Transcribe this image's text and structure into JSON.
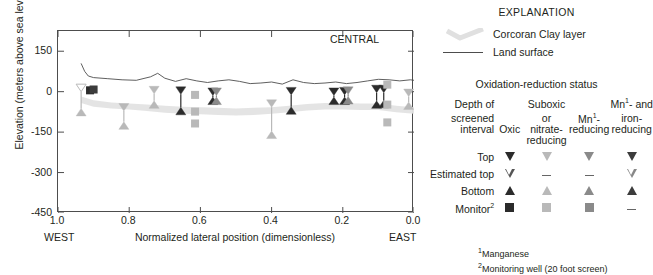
{
  "chart_data": {
    "type": "scatter",
    "title": "",
    "panel_label": "CENTRAL",
    "xlabel": "Normalized lateral position (dimensionless)",
    "ylabel": "Elevation (meters above sea level)",
    "xlim": [
      1.0,
      0.0
    ],
    "ylim": [
      -450,
      225
    ],
    "x_ticks": [
      "1.0",
      "0.8",
      "0.6",
      "0.4",
      "0.2",
      "0.0"
    ],
    "x_tick_values": [
      1.0,
      0.8,
      0.6,
      0.4,
      0.2,
      0.0
    ],
    "y_ticks": [
      "150",
      "0",
      "-150",
      "-300",
      "-450"
    ],
    "y_tick_values": [
      150,
      0,
      -150,
      -300,
      -450
    ],
    "x_left_direction": "WEST",
    "x_right_direction": "EAST",
    "grid": false,
    "legend_position": "right",
    "series": [
      {
        "name": "Land surface",
        "type": "line",
        "color": "#4d4d4d",
        "x": [
          0.935,
          0.925,
          0.915,
          0.9,
          0.86,
          0.82,
          0.78,
          0.74,
          0.72,
          0.7,
          0.67,
          0.64,
          0.61,
          0.58,
          0.55,
          0.52,
          0.49,
          0.46,
          0.43,
          0.4,
          0.37,
          0.34,
          0.31,
          0.28,
          0.25,
          0.22,
          0.19,
          0.16,
          0.13,
          0.1,
          0.07,
          0.04,
          0.01,
          0.0
        ],
        "y": [
          105,
          75,
          58,
          52,
          48,
          44,
          42,
          55,
          68,
          50,
          38,
          48,
          40,
          34,
          40,
          44,
          38,
          30,
          32,
          36,
          28,
          44,
          34,
          30,
          32,
          36,
          30,
          34,
          40,
          46,
          44,
          40,
          44,
          42
        ]
      },
      {
        "name": "Corcoran Clay layer",
        "type": "band",
        "color": "#e3e3e3",
        "x": [
          0.935,
          0.9,
          0.85,
          0.8,
          0.75,
          0.7,
          0.65,
          0.6,
          0.55,
          0.5,
          0.45,
          0.4,
          0.35,
          0.3,
          0.25,
          0.2,
          0.15,
          0.1,
          0.05,
          0.0
        ],
        "y_upper": [
          -18,
          -32,
          -40,
          -44,
          -48,
          -52,
          -56,
          -58,
          -60,
          -62,
          -60,
          -58,
          -52,
          -46,
          -42,
          -42,
          -44,
          -44,
          -52,
          -58
        ],
        "y_lower": [
          -42,
          -56,
          -62,
          -66,
          -72,
          -78,
          -82,
          -84,
          -86,
          -88,
          -86,
          -82,
          -76,
          -70,
          -66,
          -66,
          -68,
          -68,
          -76,
          -82
        ]
      }
    ],
    "wells": [
      {
        "x": 0.935,
        "top": 0,
        "bottom": -62,
        "status": "suboxic",
        "kind": "estimated_top"
      },
      {
        "x": 0.91,
        "top": 5,
        "bottom": -48,
        "status": "oxic",
        "kind": "monitor"
      },
      {
        "x": 0.9,
        "top": 8,
        "bottom": -44,
        "status": "mn_iron",
        "kind": "monitor"
      },
      {
        "x": 0.815,
        "top": -72,
        "bottom": -112,
        "status": "suboxic",
        "kind": "top_bottom"
      },
      {
        "x": 0.73,
        "top": -8,
        "bottom": -34,
        "status": "suboxic",
        "kind": "top_bottom"
      },
      {
        "x": 0.655,
        "top": -10,
        "bottom": -58,
        "status": "oxic",
        "kind": "top_bottom"
      },
      {
        "x": 0.615,
        "top": -12,
        "bottom": -12,
        "status": "suboxic",
        "kind": "monitor"
      },
      {
        "x": 0.615,
        "top": -74,
        "bottom": -74,
        "status": "suboxic",
        "kind": "monitor"
      },
      {
        "x": 0.615,
        "top": -118,
        "bottom": -118,
        "status": "suboxic",
        "kind": "monitor"
      },
      {
        "x": 0.565,
        "top": -14,
        "bottom": -20,
        "status": "oxic",
        "kind": "top_bottom"
      },
      {
        "x": 0.555,
        "top": -14,
        "bottom": -20,
        "status": "mn_reducing",
        "kind": "top_bottom"
      },
      {
        "x": 0.4,
        "top": -58,
        "bottom": -146,
        "status": "suboxic",
        "kind": "top_bottom"
      },
      {
        "x": 0.345,
        "top": -12,
        "bottom": -56,
        "status": "oxic",
        "kind": "top_bottom"
      },
      {
        "x": 0.225,
        "top": -14,
        "bottom": -20,
        "status": "oxic",
        "kind": "top_bottom"
      },
      {
        "x": 0.195,
        "top": -12,
        "bottom": -20,
        "status": "oxic",
        "kind": "top_bottom"
      },
      {
        "x": 0.185,
        "top": -10,
        "bottom": -18,
        "status": "mn_reducing",
        "kind": "top_bottom"
      },
      {
        "x": 0.105,
        "top": -4,
        "bottom": -34,
        "status": "oxic",
        "kind": "top_bottom"
      },
      {
        "x": 0.085,
        "top": -4,
        "bottom": -32,
        "status": "oxic",
        "kind": "top_bottom"
      },
      {
        "x": 0.075,
        "top": 26,
        "bottom": 26,
        "status": "suboxic",
        "kind": "monitor"
      },
      {
        "x": 0.075,
        "top": -48,
        "bottom": -48,
        "status": "suboxic",
        "kind": "monitor"
      },
      {
        "x": 0.075,
        "top": -114,
        "bottom": -114,
        "status": "suboxic",
        "kind": "monitor"
      },
      {
        "x": 0.015,
        "top": -18,
        "bottom": -38,
        "status": "suboxic",
        "kind": "top_bottom"
      }
    ]
  },
  "plot": {
    "central_label": "CENTRAL",
    "yaxis_title": "Elevation (meters above sea level)",
    "xaxis_title": "Normalized lateral position (dimensionless)",
    "west": "WEST",
    "east": "EAST"
  },
  "explanation": {
    "title": "EXPLANATION",
    "clay_label": "Corcoran Clay layer",
    "land_surface_label": "Land surface",
    "redox_title": "Oxidation-reduction status",
    "columns": [
      {
        "id": "depth",
        "lines": [
          "Depth of",
          "screened",
          "interval"
        ]
      },
      {
        "id": "oxic",
        "lines": [
          "",
          "",
          "Oxic"
        ]
      },
      {
        "id": "suboxic",
        "lines": [
          "Suboxic",
          "or",
          "nitrate-",
          "reducing"
        ]
      },
      {
        "id": "mn",
        "lines": [
          "",
          "Mn¹-",
          "reducing"
        ]
      },
      {
        "id": "mn_iron",
        "lines": [
          "Mn¹- and",
          "iron-",
          "reducing"
        ]
      }
    ],
    "col_head_oxic": "Oxic",
    "col_head_suboxic_1": "Suboxic",
    "col_head_suboxic_2": "or",
    "col_head_suboxic_3": "nitrate-",
    "col_head_suboxic_4": "reducing",
    "col_head_mn_1": "Mn",
    "col_head_mn_sup": "1",
    "col_head_mn_2": "-",
    "col_head_mn_3": "reducing",
    "col_head_mniron_1": "Mn",
    "col_head_mniron_sup": "1",
    "col_head_mniron_2": "- and",
    "col_head_mniron_3": "iron-",
    "col_head_mniron_4": "reducing",
    "col_head_depth_1": "Depth of",
    "col_head_depth_2": "screened",
    "col_head_depth_3": "interval",
    "rows": [
      {
        "label": "Top",
        "symbol": "triangle-down"
      },
      {
        "label": "Estimated top",
        "symbol": "triangle-down-open"
      },
      {
        "label": "Bottom",
        "symbol": "triangle-up"
      },
      {
        "label": "Monitor",
        "sup": "2",
        "symbol": "square"
      }
    ],
    "row_top": "Top",
    "row_estimated_top": "Estimated top",
    "row_bottom": "Bottom",
    "row_monitor": "Monitor",
    "row_monitor_sup": "2",
    "footnote_1_sup": "1",
    "footnote_1": "Manganese",
    "footnote_2_sup": "2",
    "footnote_2": "Monitoring well (20 foot screen)"
  },
  "colors": {
    "oxic": "#2b2b2b",
    "suboxic": "#b9b9b9",
    "mn_reducing": "#8a8a8a",
    "mn_iron": "#3c3c3c",
    "clay_band": "#e6e6e6",
    "land_surface": "#4d4d4d",
    "axis": "#4d4d4d",
    "text": "#231f20"
  }
}
